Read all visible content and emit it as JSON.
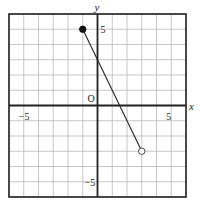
{
  "chart_data": {
    "type": "line",
    "title": "",
    "xlabel": "x",
    "ylabel": "y",
    "xlim": [
      -6,
      6
    ],
    "ylim": [
      -6,
      6
    ],
    "grid": true,
    "origin_label": "O",
    "tick_labels": {
      "x": [
        {
          "value": -5,
          "label": "−5"
        },
        {
          "value": 5,
          "label": "5"
        }
      ],
      "y": [
        {
          "value": 5,
          "label": "5"
        },
        {
          "value": -5,
          "label": "−5"
        }
      ]
    },
    "series": [
      {
        "name": "segment",
        "points": [
          {
            "x": -1,
            "y": 5
          },
          {
            "x": 3,
            "y": -3
          }
        ],
        "start_marker": "filled-circle",
        "end_marker": "open-circle"
      }
    ]
  },
  "colors": {
    "grid": "#b8b8b8",
    "axis": "#222222",
    "frame": "#222222",
    "line": "#222222"
  }
}
